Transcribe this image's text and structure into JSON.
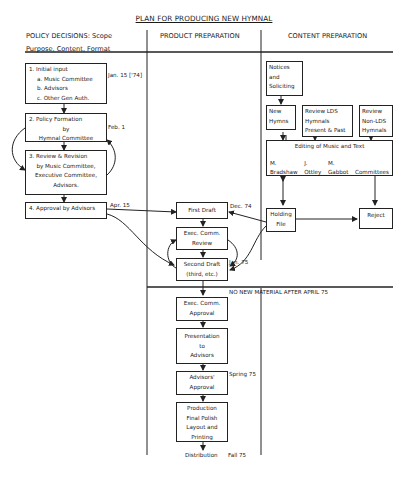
{
  "title": "PLAN FOR PRODUCING NEW HYMNAL",
  "columns": {
    "policy": {
      "line1": "POLICY DECISIONS: Scope",
      "line2": "Purpose, Content, Format"
    },
    "product": {
      "label": "PRODUCT PREPARATION"
    },
    "content": {
      "label": "CONTENT PREPARATION"
    }
  },
  "policy": {
    "step1": {
      "heading": "1.  Initial input",
      "items": [
        "a. Music Committee",
        "b. Advisors",
        "c. Other Gen Auth."
      ],
      "date": "Jan. 15 ['74]"
    },
    "step2": {
      "lines": [
        "2.  Policy Formation",
        "by",
        "Hymnal Committee"
      ],
      "date": "Feb. 1"
    },
    "step3": {
      "lines": [
        "3.  Review & Revision",
        "by Music Committee,",
        "Executive Committee,",
        "Advisors."
      ]
    },
    "step4": {
      "label": "4. Approval by Advisors",
      "date": "Apr. 15"
    }
  },
  "product": {
    "first_draft": {
      "label": "First Draft",
      "date": "Dec. 74"
    },
    "exec_review": {
      "lines": [
        "Exec. Comm.",
        "Review"
      ]
    },
    "second_draft": {
      "lines": [
        "Second Draft",
        "(third, etc.)"
      ],
      "date": "Jan. 75"
    },
    "cutoff_note": "NO NEW MATERIAL AFTER APRIL 75",
    "exec_approval": {
      "lines": [
        "Exec. Comm.",
        "Approval"
      ]
    },
    "presentation": {
      "lines": [
        "Presentation",
        "to",
        "Advisors"
      ]
    },
    "advisors_approval": {
      "lines": [
        "Advisors'",
        "Approval"
      ],
      "date": "Spring 75"
    },
    "production": {
      "lines": [
        "Production",
        "Final Polish",
        "Layout and",
        "Printing"
      ]
    },
    "distribution": {
      "label": "Distribution",
      "date": "Fall 75"
    }
  },
  "content": {
    "notices": {
      "lines": [
        "Notices",
        "and",
        "Soliciting"
      ]
    },
    "new_hymns": {
      "lines": [
        "New",
        "Hymns"
      ]
    },
    "review_lds": {
      "lines": [
        "Review LDS",
        "Hymnals",
        "Present & Past"
      ]
    },
    "review_non_lds": {
      "lines": [
        "Review",
        "Non-LDS",
        "Hymnals"
      ]
    },
    "editing": {
      "label": "Editing of Music and Text",
      "editors": [
        {
          "initial": "M.",
          "name": "Bradshaw"
        },
        {
          "initial": "J.",
          "name": "Ottley"
        },
        {
          "initial": "M.",
          "name": "Gabbot"
        },
        {
          "initial": "",
          "name": "Committees"
        }
      ]
    },
    "holding_file": {
      "lines": [
        "Holding",
        "File"
      ]
    },
    "reject": {
      "label": "Reject"
    }
  }
}
